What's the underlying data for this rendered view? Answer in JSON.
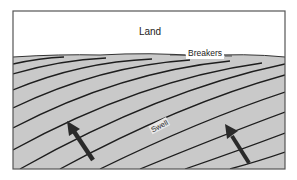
{
  "diagram": {
    "labels": {
      "land": "Land",
      "breakers": "Breakers",
      "swell": "Swell"
    },
    "colors": {
      "land": "#ffffff",
      "sea": "#c9c9c9",
      "crest_lines": "#1e1e1e",
      "arrows": "#2a2a2a",
      "frame": "#555555"
    },
    "arrows": [
      {
        "name": "swell-direction-arrow-left",
        "from": [
          88,
          158
        ],
        "to": [
          68,
          124
        ]
      },
      {
        "name": "swell-direction-arrow-right",
        "from": [
          248,
          162
        ],
        "to": [
          226,
          128
        ]
      }
    ]
  }
}
